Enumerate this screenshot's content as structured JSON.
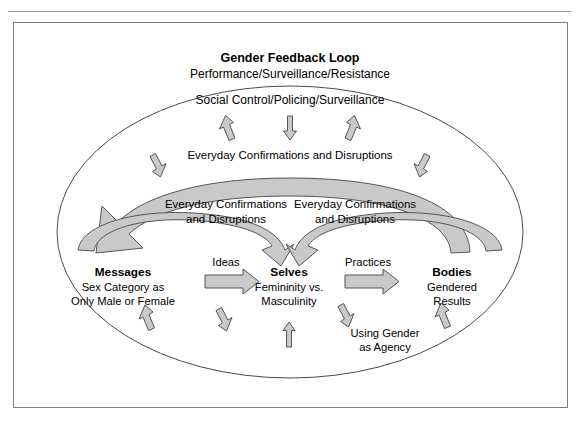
{
  "figure": {
    "title": "Gender Feedback Loop",
    "subtitle": "Performance/Surveillance/Resistance",
    "social_control": "Social Control/Policing/Surveillance",
    "outer_loop_label": "Everyday Confirmations and Disruptions",
    "inner_loop_left_line1": "Everyday Confirmations",
    "inner_loop_left_line2": "and Disruptions",
    "inner_loop_right_line1": "Everyday Confirmations",
    "inner_loop_right_line2": "and Disruptions",
    "agency_line1": "Using Gender",
    "agency_line2": "as Agency"
  },
  "nodes": [
    {
      "id": "messages",
      "heading": "Messages",
      "line1": "Sex Category as",
      "line2": "Only Male or Female"
    },
    {
      "id": "selves",
      "heading": "Selves",
      "line1": "Femininity vs.",
      "line2": "Masculinity"
    },
    {
      "id": "bodies",
      "heading": "Bodies",
      "line1": "Gendered",
      "line2": "Results"
    }
  ],
  "connectors": [
    {
      "id": "ideas",
      "label": "Ideas"
    },
    {
      "id": "practices",
      "label": "Practices"
    }
  ],
  "colors": {
    "arrow_fill": "#c9c9c9",
    "arrow_stroke": "#555555",
    "ellipse_stroke": "#4a4a4a",
    "frame_stroke": "#7c7c7c",
    "rule": "#9a9a9a",
    "text": "#000000"
  }
}
